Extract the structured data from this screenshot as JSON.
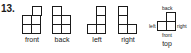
{
  "problem": {
    "number": "13.",
    "views": [
      {
        "id": "front",
        "label": "front"
      },
      {
        "id": "back",
        "label": "back"
      },
      {
        "id": "left",
        "label": "left"
      },
      {
        "id": "right",
        "label": "right"
      },
      {
        "id": "top",
        "label": "top"
      }
    ],
    "top_view_directions": {
      "back": "back",
      "left": "left",
      "right": "right",
      "front": "front"
    }
  }
}
